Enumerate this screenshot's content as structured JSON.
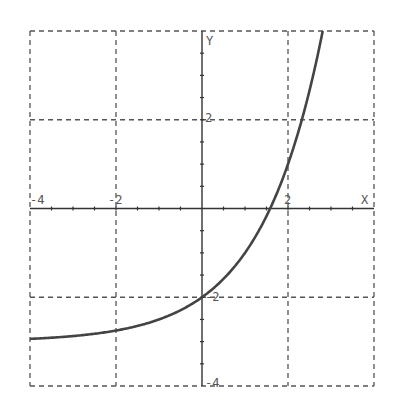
{
  "chart_data": {
    "type": "line",
    "title": "",
    "function": "y = 2^x - 3",
    "xlabel": "X",
    "ylabel": "Y",
    "xlim": [
      -4,
      4
    ],
    "ylim": [
      -4,
      4
    ],
    "grid": true,
    "grid_style": "dashed",
    "x_ticks": [
      -4,
      -3,
      -2,
      -1,
      0,
      1,
      2,
      3,
      4
    ],
    "y_ticks": [
      -4,
      -3,
      -2,
      -1,
      0,
      1,
      2,
      3,
      4
    ],
    "x_tick_labels": [
      "-4",
      "-2",
      "2"
    ],
    "y_tick_labels": [
      "2",
      "-2",
      "-4"
    ],
    "series": [
      {
        "name": "curve",
        "x": [
          -4,
          -3,
          -2,
          -1,
          0,
          1,
          1.585,
          2,
          2.322,
          2.5,
          2.807
        ],
        "y": [
          -2.94,
          -2.88,
          -2.75,
          -2.5,
          -2,
          -1,
          0,
          1,
          2,
          2.66,
          4
        ]
      }
    ],
    "asymptote": -3
  },
  "labels": {
    "x_axis": "X",
    "y_axis": "Y",
    "xm4": "-4",
    "xm2": "-2",
    "x2": "2",
    "y2": "2",
    "ym2": "-2",
    "ym4": "-4"
  },
  "colors": {
    "grid": "#555555",
    "axis": "#333333",
    "curve": "#444444",
    "label": "#555555"
  }
}
